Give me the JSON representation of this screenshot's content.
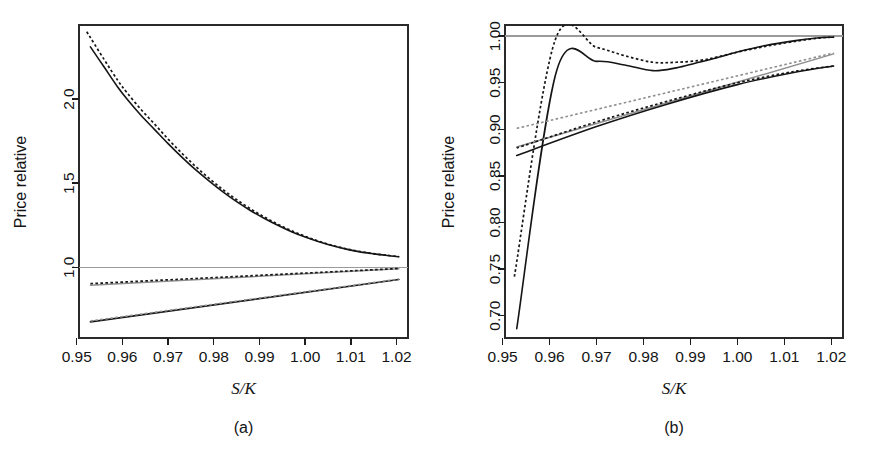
{
  "figure": {
    "background_color": "#ffffff",
    "panels": [
      "a",
      "b"
    ]
  },
  "panel_a": {
    "caption": "(a)",
    "xlabel": "S/K",
    "ylabel": "Price relative"
  },
  "panel_b": {
    "caption": "(b)",
    "xlabel": "S/K",
    "ylabel": "Price relative"
  },
  "colors": {
    "dark": "#151515",
    "gray": "#8e8e8e",
    "reference": "#9a9a9a",
    "axis": "#1d1d1d"
  },
  "chart_data": [
    {
      "id": "panel-a",
      "type": "line",
      "title": "(a)",
      "xlabel": "S/K",
      "ylabel": "Price relative",
      "xlim": [
        0.9505,
        1.0225
      ],
      "ylim": [
        0.58,
        2.44
      ],
      "xticks": [
        0.95,
        0.96,
        0.97,
        0.98,
        0.99,
        1.0,
        1.01,
        1.02
      ],
      "xticklabels": [
        "0.95",
        "0.96",
        "0.97",
        "0.98",
        "0.99",
        "1.00",
        "1.01",
        "1.02"
      ],
      "yticks": [
        1.0,
        1.5,
        2.0
      ],
      "yticklabels": [
        "1.0",
        "1.5",
        "2.0"
      ],
      "grid": false,
      "legend": "none",
      "reference_lines": [
        {
          "name": "unit-price-relative",
          "orientation": "horizontal",
          "y": 1.0,
          "color": "#9a9a9a",
          "style": "solid"
        }
      ],
      "series": [
        {
          "name": "upper-curve-solid",
          "style": "solid",
          "color": "#151515",
          "x": [
            0.953,
            0.956,
            0.959,
            0.961,
            0.964,
            0.967,
            0.97,
            0.973,
            0.976,
            0.979,
            0.982,
            0.985,
            0.988,
            0.991,
            0.994,
            0.997,
            1.0,
            1.003,
            1.006,
            1.009,
            1.012,
            1.015,
            1.018,
            1.0205
          ],
          "y": [
            2.31,
            2.19,
            2.07,
            2.0,
            1.905,
            1.82,
            1.735,
            1.655,
            1.58,
            1.512,
            1.448,
            1.39,
            1.338,
            1.292,
            1.25,
            1.212,
            1.18,
            1.152,
            1.128,
            1.108,
            1.092,
            1.08,
            1.07,
            1.063
          ]
        },
        {
          "name": "upper-curve-dotted",
          "style": "dotted",
          "color": "#151515",
          "x": [
            0.9522,
            0.956,
            0.959,
            0.961,
            0.964,
            0.967,
            0.97,
            0.973,
            0.976,
            0.979,
            0.982,
            0.985,
            0.988,
            0.991,
            0.994,
            0.997,
            1.0,
            1.003,
            1.006,
            1.009,
            1.012,
            1.015,
            1.018,
            1.0205
          ],
          "y": [
            2.4,
            2.235,
            2.11,
            2.038,
            1.94,
            1.852,
            1.762,
            1.678,
            1.6,
            1.528,
            1.462,
            1.402,
            1.348,
            1.3,
            1.256,
            1.218,
            1.184,
            1.155,
            1.13,
            1.11,
            1.094,
            1.081,
            1.071,
            1.064
          ]
        },
        {
          "name": "middle-line-solid-gray",
          "style": "solid",
          "color": "#8e8e8e",
          "x": [
            0.953,
            1.0205
          ],
          "y": [
            0.893,
            0.992
          ]
        },
        {
          "name": "middle-line-dotted-dark",
          "style": "dotted",
          "color": "#151515",
          "x": [
            0.953,
            1.0205
          ],
          "y": [
            0.903,
            0.993
          ]
        },
        {
          "name": "lower-line-solid-dark",
          "style": "solid",
          "color": "#151515",
          "x": [
            0.953,
            1.0205
          ],
          "y": [
            0.676,
            0.928
          ]
        },
        {
          "name": "lower-line-dotted-gray",
          "style": "dotted",
          "color": "#8e8e8e",
          "x": [
            0.953,
            1.0205
          ],
          "y": [
            0.681,
            0.93
          ]
        }
      ]
    },
    {
      "id": "panel-b",
      "type": "line",
      "title": "(b)",
      "xlabel": "S/K",
      "ylabel": "Price relative",
      "xlim": [
        0.9505,
        1.0225
      ],
      "ylim": [
        0.676,
        1.012
      ],
      "xticks": [
        0.95,
        0.96,
        0.97,
        0.98,
        0.99,
        1.0,
        1.01,
        1.02
      ],
      "xticklabels": [
        "0.95",
        "0.96",
        "0.97",
        "0.98",
        "0.99",
        "1.00",
        "1.01",
        "1.02"
      ],
      "yticks": [
        0.7,
        0.75,
        0.8,
        0.85,
        0.9,
        0.95,
        1.0
      ],
      "yticklabels": [
        "0.70",
        "0.75",
        "0.80",
        "0.85",
        "0.90",
        "0.95",
        "1.00"
      ],
      "grid": false,
      "legend": "none",
      "reference_lines": [
        {
          "name": "unit-price-relative",
          "orientation": "horizontal",
          "y": 1.0,
          "color": "#9a9a9a",
          "style": "solid"
        }
      ],
      "series": [
        {
          "name": "steep-curve-solid",
          "style": "solid",
          "color": "#151515",
          "x": [
            0.953,
            0.9615,
            0.97,
            0.976,
            0.982,
            0.987,
            0.991,
            0.995,
            1.0,
            1.006,
            1.012,
            1.017,
            1.0205
          ],
          "y": [
            0.686,
            0.963,
            0.973,
            0.969,
            0.963,
            0.966,
            0.971,
            0.976,
            0.983,
            0.99,
            0.995,
            0.998,
            0.999
          ]
        },
        {
          "name": "steep-curve-dotted",
          "style": "dotted",
          "color": "#151515",
          "x": [
            0.9525,
            0.9612,
            0.97,
            0.976,
            0.982,
            0.987,
            0.992,
            0.996,
            1.001,
            1.007,
            1.013,
            1.0175,
            1.0205
          ],
          "y": [
            0.742,
            0.996,
            0.988,
            0.979,
            0.972,
            0.972,
            0.974,
            0.978,
            0.984,
            0.99,
            0.995,
            0.998,
            0.999
          ]
        },
        {
          "name": "mid-line-solid-gray",
          "style": "solid",
          "color": "#8e8e8e",
          "x": [
            0.953,
            1.0205
          ],
          "y": [
            0.881,
            0.981
          ]
        },
        {
          "name": "mid-line-dotted-gray",
          "style": "dotted",
          "color": "#8e8e8e",
          "x": [
            0.953,
            1.0205
          ],
          "y": [
            0.901,
            0.982
          ]
        },
        {
          "name": "low-line-solid-dark",
          "style": "solid",
          "color": "#151515",
          "x": [
            0.953,
            0.97,
            0.985,
            1.0,
            1.012,
            1.0205
          ],
          "y": [
            0.872,
            0.903,
            0.927,
            0.948,
            0.961,
            0.968
          ]
        },
        {
          "name": "low-line-dotted-dark",
          "style": "dotted",
          "color": "#151515",
          "x": [
            0.953,
            0.97,
            0.985,
            1.0,
            1.012,
            1.0205
          ],
          "y": [
            0.88,
            0.908,
            0.93,
            0.95,
            0.962,
            0.968
          ]
        }
      ]
    }
  ]
}
